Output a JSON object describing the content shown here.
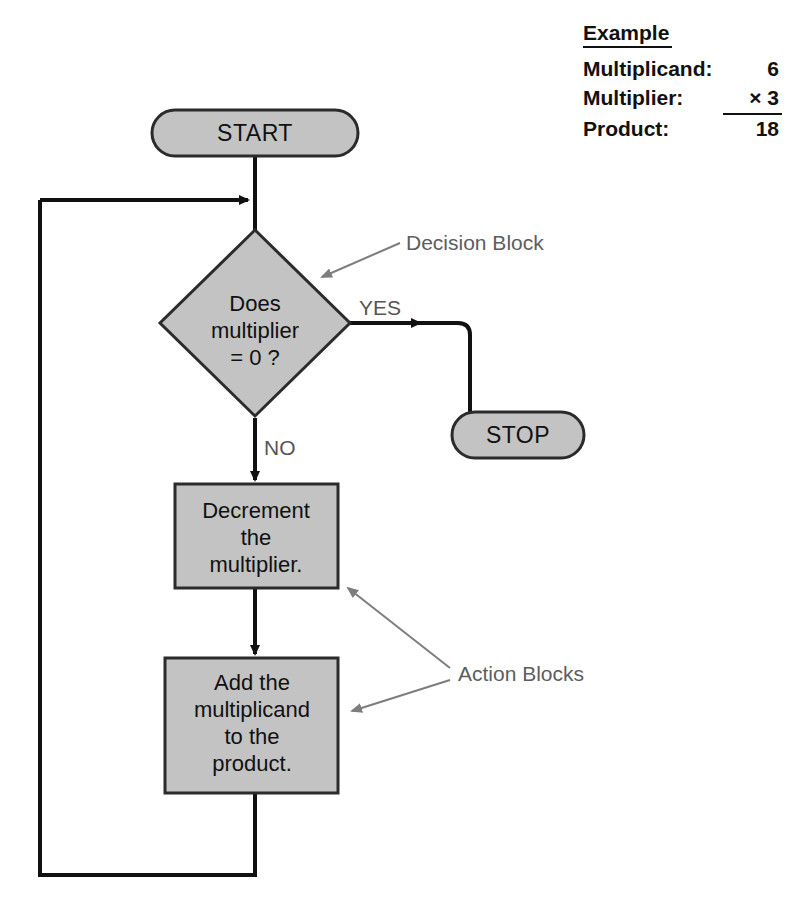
{
  "figure": {
    "colors": {
      "shape_fill": "#c3c3c3",
      "shape_stroke": "#2b2b2b",
      "flow_line": "#111111",
      "annotation": "#7d7d7d",
      "text": "#111111",
      "background": "#ffffff"
    }
  },
  "example": {
    "heading": "Example",
    "rows": [
      {
        "label": "Multiplicand:",
        "value": "6"
      },
      {
        "label": "Multiplier:",
        "value": "× 3"
      },
      {
        "label": "Product:",
        "value": "18"
      }
    ]
  },
  "nodes": {
    "start": {
      "type": "terminal",
      "label": "START"
    },
    "stop": {
      "type": "terminal",
      "label": "STOP"
    },
    "decision": {
      "type": "decision",
      "lines": [
        "Does",
        "multiplier",
        "= 0 ?"
      ]
    },
    "action1": {
      "type": "process",
      "lines": [
        "Decrement",
        "the",
        "multiplier."
      ]
    },
    "action2": {
      "type": "process",
      "lines": [
        "Add the",
        "multiplicand",
        "to the",
        "product."
      ]
    }
  },
  "edges": {
    "yes_label": "YES",
    "no_label": "NO"
  },
  "annotations": {
    "decision_block": "Decision Block",
    "action_blocks": "Action Blocks"
  }
}
